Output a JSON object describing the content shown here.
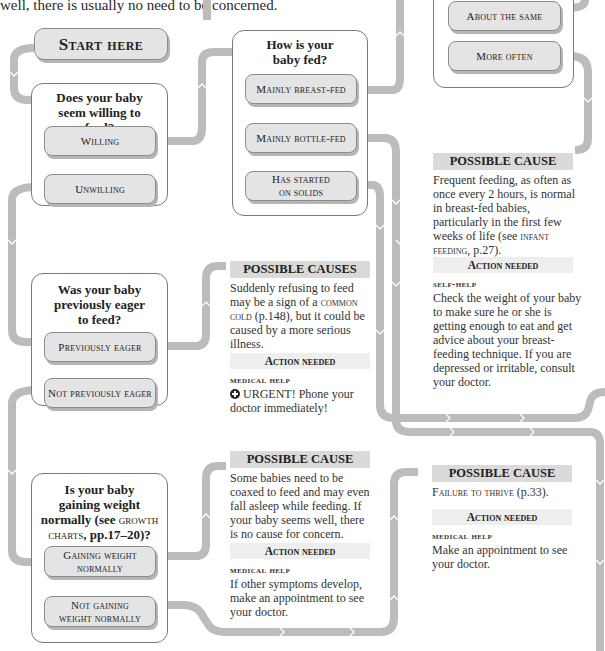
{
  "intro_text": "well, there is usually no need to be concerned.",
  "start": {
    "label": "Start here"
  },
  "questions": {
    "willing": {
      "title": "Does your baby seem willing to feed?",
      "options": [
        "Willing",
        "Unwilling"
      ]
    },
    "fed": {
      "title_line1": "How is your",
      "title_line2": "baby fed?",
      "options": [
        "Mainly breast-fed",
        "Mainly bottle-fed",
        "Has started",
        "on solids"
      ]
    },
    "frequency": {
      "options": [
        "About the same",
        "More often"
      ]
    },
    "eager": {
      "title_line1": "Was your baby",
      "title_line2": "previously eager",
      "title_line3": "to feed?",
      "options": [
        "Previously eager",
        "Not previously eager"
      ]
    },
    "weight": {
      "title_line1": "Is your baby",
      "title_line2": "gaining weight",
      "title_line3a": "normally (see ",
      "title_line3b": "growth",
      "title_line4a": "charts",
      "title_line4b": ", pp.17–20)?",
      "options": [
        "Gaining weight",
        "normally",
        "Not gaining",
        "weight normally"
      ]
    }
  },
  "results": {
    "frequent_feeding": {
      "heading": "POSSIBLE CAUSE",
      "body_main": "Frequent feeding, as often as once every 2 hours, is normal in breast-fed babies, particularly in the first few weeks of life (see ",
      "body_ref": "infant feeding",
      "body_end": ", p.27).",
      "action_heading": "Action needed",
      "help_label": "SELF-HELP",
      "help_text": "Check the weight of your baby to make sure he or she is getting enough to eat and get advice about your breast-feeding technique. If you are depressed or irritable, consult your doctor."
    },
    "refusing": {
      "heading": "POSSIBLE CAUSES",
      "body_a": "Suddenly refusing to feed may be a sign of a ",
      "body_ref": "common cold",
      "body_b": " (p.148), but it could be caused by a more serious illness.",
      "action_heading": "Action needed",
      "help_label": "MEDICAL HELP",
      "help_text": "URGENT! Phone your doctor immediately!"
    },
    "coaxed": {
      "heading": "POSSIBLE CAUSE",
      "body": "Some babies need to be coaxed to feed and may even fall asleep while feeding. If your baby seems well, there is no cause for concern.",
      "action_heading": "Action needed",
      "help_label": "MEDICAL HELP",
      "help_text": "If other symptoms develop, make an appointment to see your doctor."
    },
    "failure_to_thrive": {
      "heading": "POSSIBLE CAUSE",
      "body_ref": "Failure to thrive",
      "body_end": " (p.33).",
      "action_heading": "Action needed",
      "help_label": "MEDICAL HELP",
      "help_text": "Make an appointment to see your doctor."
    }
  },
  "colors": {
    "pipe": "#bcbcbc",
    "button_fill": "#e4e4e4",
    "heading_fill": "#dadada",
    "action_fill": "#eeeeee",
    "frame_border": "#7a7a7a"
  }
}
